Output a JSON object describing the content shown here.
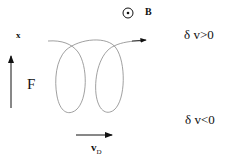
{
  "diagram": {
    "labels": {
      "x_axis": "x",
      "force": "F",
      "field": "B",
      "upper_region": "δ v>0",
      "lower_region": "δ v<0",
      "drift_main": "v",
      "drift_sub": "D"
    },
    "colors": {
      "trajectory": "#888888",
      "arrows": "#111111",
      "text": "#111111"
    }
  }
}
